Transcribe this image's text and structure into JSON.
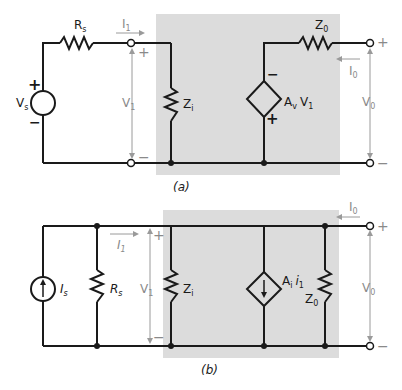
{
  "colors": {
    "wire": "#1a1a1a",
    "box": "#dcdcdc",
    "annotation": "#9a9a9a"
  },
  "diagram_a": {
    "caption": "(a)",
    "source_label": "V",
    "source_sub": "s",
    "source_plus": "+",
    "source_minus": "−",
    "rs_label": "R",
    "rs_sub": "s",
    "i1_label": "I",
    "i1_sub": "1",
    "v1_label": "V",
    "v1_sub": "1",
    "v1_plus": "+",
    "v1_minus": "−",
    "zi_label": "Z",
    "zi_sub": "i",
    "dep_label": "A",
    "dep_sub": "v",
    "dep_label2": "V",
    "dep_sub2": "1",
    "dep_plus": "+",
    "dep_minus": "−",
    "zo_label": "Z",
    "zo_sub": "0",
    "io_label": "I",
    "io_sub": "0",
    "vo_label": "V",
    "vo_sub": "0",
    "vo_plus": "+",
    "vo_minus": "−"
  },
  "diagram_b": {
    "caption": "(b)",
    "source_label": "I",
    "source_sub": "s",
    "rs_label": "R",
    "rs_sub": "s",
    "i1_label": "I",
    "i1_sub": "1",
    "v1_label": "V",
    "v1_sub": "1",
    "v1_plus": "+",
    "v1_minus": "−",
    "zi_label": "Z",
    "zi_sub": "i",
    "dep_label": "A",
    "dep_sub": "i",
    "dep_label2": "i",
    "dep_sub2": "1",
    "zo_label": "Z",
    "zo_sub": "0",
    "io_label": "I",
    "io_sub": "0",
    "vo_label": "V",
    "vo_sub": "0",
    "vo_plus": "+",
    "vo_minus": "−"
  }
}
